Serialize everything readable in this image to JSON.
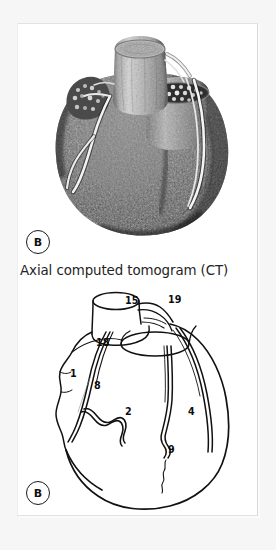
{
  "figure": {
    "panel_a": {
      "letter": "B",
      "caption": "Axial computed tomogram (CT)",
      "image_name": "heart-3d-ct-reconstruction"
    },
    "panel_b": {
      "letter": "B",
      "image_name": "heart-coronary-line-diagram",
      "labels": [
        {
          "id": "label-15",
          "text": "15",
          "x": 107,
          "y": 8,
          "structure": "aorta"
        },
        {
          "id": "label-19",
          "text": "19",
          "x": 150,
          "y": 7,
          "structure": "superior-vena-cava"
        },
        {
          "id": "label-18",
          "text": "18",
          "x": 78,
          "y": 50,
          "structure": "right-atrium"
        },
        {
          "id": "label-1",
          "text": "1",
          "x": 52,
          "y": 81,
          "structure": "right-coronary-artery"
        },
        {
          "id": "label-8",
          "text": "8",
          "x": 76,
          "y": 93,
          "structure": "anterior-interventricular-branch"
        },
        {
          "id": "label-2",
          "text": "2",
          "x": 107,
          "y": 119,
          "structure": "right-ventricle"
        },
        {
          "id": "label-4",
          "text": "4",
          "x": 170,
          "y": 119,
          "structure": "left-ventricle"
        },
        {
          "id": "label-9",
          "text": "9",
          "x": 150,
          "y": 157,
          "structure": "marginal-branch"
        }
      ],
      "leader_lines": [
        {
          "id": "leader-8",
          "from_x": 72,
          "from_y": 93,
          "to_x": 58,
          "to_y": 88
        }
      ]
    }
  },
  "colors": {
    "page_background": "#f6f6f6",
    "card_background": "#ffffff",
    "ink": "#111111",
    "caption_text": "#242424",
    "border": "#e2e2e2"
  }
}
